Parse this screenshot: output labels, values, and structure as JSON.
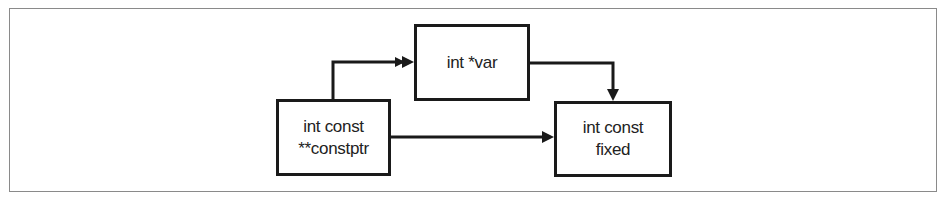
{
  "diagram": {
    "type": "flow",
    "nodes": [
      {
        "id": "constptr",
        "lines": [
          "int const",
          "**constptr"
        ]
      },
      {
        "id": "var",
        "lines": [
          "int *var"
        ]
      },
      {
        "id": "fixed",
        "lines": [
          "int const",
          "fixed"
        ]
      }
    ],
    "edges": [
      {
        "from": "constptr",
        "to": "var"
      },
      {
        "from": "var",
        "to": "fixed"
      },
      {
        "from": "constptr",
        "to": "fixed"
      }
    ],
    "colors": {
      "stroke": "#1a1a1a",
      "text": "#222222",
      "frame": "#8a8a8a",
      "background": "#ffffff"
    }
  }
}
